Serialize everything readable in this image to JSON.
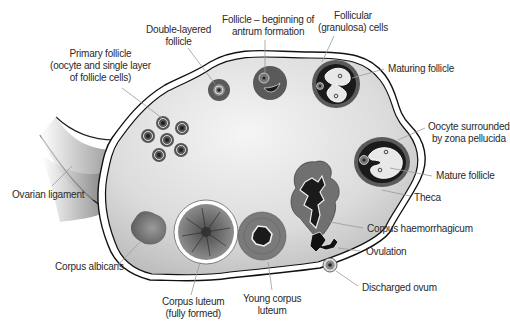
{
  "colors": {
    "ovary_fill_light": "#f2f2f2",
    "ovary_fill_dark": "#bdbdbd",
    "follicle_dark": "#5a5a5a",
    "follicle_black": "#1e1e1e",
    "leader_line": "#9a9a9a",
    "label_text": "#2a2a2a"
  },
  "labels": {
    "primary_follicle": [
      "Primary follicle",
      "(oocyte and single layer",
      "of follicle cells)"
    ],
    "double_layered": [
      "Double-layered",
      "follicle"
    ],
    "antrum": [
      "Follicle – beginning of",
      "antrum formation"
    ],
    "granulosa": [
      "Follicular",
      "(granulosa) cells"
    ],
    "maturing": [
      "Maturing follicle"
    ],
    "zona": [
      "Oocyte surrounded",
      "by zona pellucida"
    ],
    "mature": [
      "Mature follicle"
    ],
    "theca": [
      "Theca"
    ],
    "haemorrhagicum": [
      "Corpus haemorrhagicum"
    ],
    "ovulation": [
      "Ovulation"
    ],
    "discharged": [
      "Discharged ovum"
    ],
    "ligament": [
      "Ovarian ligament"
    ],
    "albicans": [
      "Corpus albicans"
    ],
    "luteum_full": [
      "Corpus luteum",
      "(fully formed)"
    ],
    "luteum_young": [
      "Young corpus",
      "luteum"
    ]
  }
}
